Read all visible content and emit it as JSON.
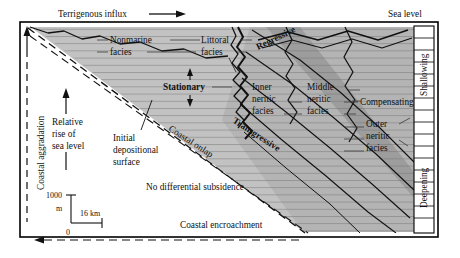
{
  "figure": {
    "type": "stratigraphic-cross-section",
    "title_top_left": "Terrigenous influx",
    "title_top_right": "Sea level",
    "background_color": "#ffffff",
    "frame_color": "#000000",
    "wedge_fill": "#b9b9b9",
    "wedge_fill_light": "#cfcfcf",
    "wedge_fill_dark": "#9a9a9a",
    "white_fill": "#ffffff"
  },
  "axes": {
    "left_label": "Coastal aggradation",
    "right_upper_label": "Shallowing",
    "right_lower_label": "Deepening"
  },
  "arrows": {
    "terrigenous_influx": "Terrigenous influx",
    "relative_rise_of_sea_level": "Relative rise of sea level",
    "coastal_encroachment": "Coastal encroachment",
    "stationary": "Stationary"
  },
  "facies": [
    {
      "id": "nonmarine",
      "line1": "Nonmarine",
      "line2": "facies"
    },
    {
      "id": "littoral",
      "line1": "Littoral",
      "line2": "facies"
    },
    {
      "id": "inner-neritic",
      "line1": "Inner",
      "line2": "neritic",
      "line3": "facies"
    },
    {
      "id": "middle-neritic",
      "line1": "Middle",
      "line2": "neritic",
      "line3": "facies"
    },
    {
      "id": "outer-neritic",
      "line1": "Outer",
      "line2": "neritic",
      "line3": "facies"
    }
  ],
  "annotations": {
    "regressive": "Regressive",
    "transgressive": "Transgressive",
    "stationary": "Stationary",
    "coastal_onlap": "Coastal onlap",
    "compensating": "Compensating",
    "initial_depositional_surface": {
      "line1": "Initial",
      "line2": "depositional",
      "line3": "surface"
    },
    "relative_rise": {
      "line1": "Relative",
      "line2": "rise of",
      "line3": "sea level"
    },
    "no_differential_subsidence": "No differential subsidence",
    "coastal_encroachment": "Coastal encroachment"
  },
  "scale_bar": {
    "vertical_top": "1000",
    "vertical_unit": "m",
    "vertical_bottom": "0",
    "horizontal": "16 km"
  }
}
